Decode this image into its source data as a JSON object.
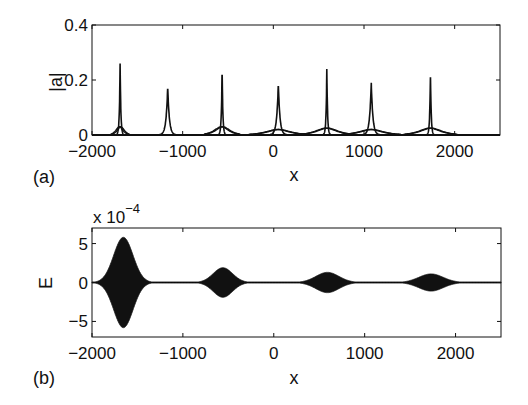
{
  "chart_data": [
    {
      "panel": "(a)",
      "type": "line",
      "title": "",
      "xlabel": "x",
      "ylabel": "|a|",
      "xlim": [
        -2000,
        2500
      ],
      "ylim": [
        0,
        0.4
      ],
      "xticks": [
        -2000,
        -1000,
        0,
        1000,
        2000
      ],
      "xtick_labels": [
        "−2000",
        "−1000",
        "0",
        "1000",
        "2000"
      ],
      "yticks": [
        0,
        0.2,
        0.4
      ],
      "ytick_labels": [
        "0",
        "0.2",
        "0.4"
      ],
      "grid": false,
      "legend": null,
      "series": [
        {
          "name": "narrow peaks",
          "peaks": [
            {
              "x": -1690,
              "height": 0.26,
              "width": 8,
              "base_hump": 0.03,
              "base_width": 60
            },
            {
              "x": -1165,
              "height": 0.175,
              "width": 18,
              "base_hump": 0.0,
              "base_width": 0
            },
            {
              "x": -565,
              "height": 0.245,
              "width": 8,
              "base_hump": 0.03,
              "base_width": 120
            },
            {
              "x": 55,
              "height": 0.185,
              "width": 18,
              "base_hump": 0.02,
              "base_width": 200
            },
            {
              "x": 590,
              "height": 0.24,
              "width": 8,
              "base_hump": 0.025,
              "base_width": 180
            },
            {
              "x": 1080,
              "height": 0.19,
              "width": 18,
              "base_hump": 0.02,
              "base_width": 200
            },
            {
              "x": 1733,
              "height": 0.235,
              "width": 8,
              "base_hump": 0.025,
              "base_width": 180
            }
          ]
        }
      ]
    },
    {
      "panel": "(b)",
      "type": "area",
      "title": "",
      "xlabel": "x",
      "ylabel": "E",
      "y_multiplier_label": "x 10",
      "y_multiplier_exponent": "−4",
      "xlim": [
        -2000,
        2500
      ],
      "ylim": [
        -7,
        7
      ],
      "xticks": [
        -2000,
        -1000,
        0,
        1000,
        2000
      ],
      "xtick_labels": [
        "−2000",
        "−1000",
        "0",
        "1000",
        "2000"
      ],
      "yticks": [
        -5,
        0,
        5
      ],
      "ytick_labels": [
        "−5",
        "0",
        "5"
      ],
      "grid": false,
      "legend": null,
      "series": [
        {
          "name": "oscillation envelope (filled)",
          "envelopes": [
            {
              "x": -1655,
              "amplitude": 5.8,
              "halfwidth": 150
            },
            {
              "x": -560,
              "amplitude": 1.9,
              "halfwidth": 150
            },
            {
              "x": 590,
              "amplitude": 1.3,
              "halfwidth": 180
            },
            {
              "x": 1730,
              "amplitude": 1.1,
              "halfwidth": 190
            }
          ],
          "baseline_amplitude": 0.08
        }
      ]
    }
  ],
  "figure": {
    "panel_a_label": "(a)",
    "panel_b_label": "(b)",
    "panel_a_xlabel": "x",
    "panel_b_xlabel": "x",
    "panel_a_ylabel": "|a|",
    "panel_b_ylabel": "E",
    "multiplier_text": "x 10",
    "multiplier_exp": "−4",
    "line_color": "#111111",
    "background": "#ffffff"
  }
}
